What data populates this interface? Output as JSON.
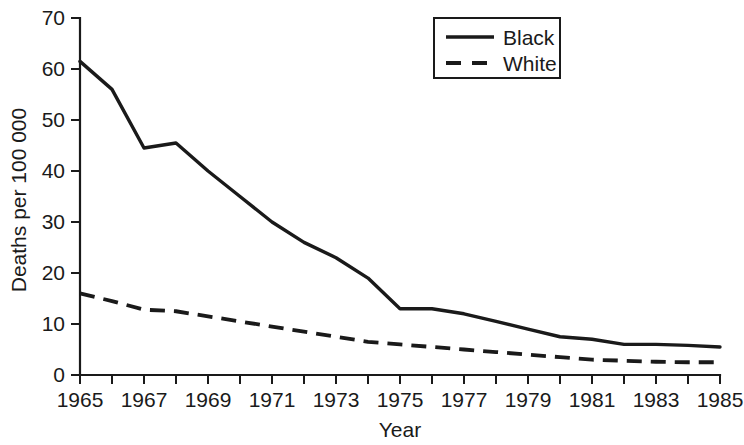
{
  "chart_data": {
    "type": "line",
    "title": "",
    "xlabel": "Year",
    "ylabel": "Deaths per 100 000",
    "xlim": [
      1965,
      1985
    ],
    "ylim": [
      0,
      70
    ],
    "grid": false,
    "legend_position": "top-right",
    "x": [
      1965,
      1966,
      1967,
      1968,
      1969,
      1970,
      1971,
      1972,
      1973,
      1974,
      1975,
      1976,
      1977,
      1978,
      1979,
      1980,
      1981,
      1982,
      1983,
      1984,
      1985
    ],
    "xticks": [
      1965,
      1966,
      1967,
      1968,
      1969,
      1970,
      1971,
      1972,
      1973,
      1974,
      1975,
      1976,
      1977,
      1978,
      1979,
      1980,
      1981,
      1982,
      1983,
      1984,
      1985
    ],
    "xtick_labels": [
      "1965",
      "",
      "1967",
      "",
      "1969",
      "",
      "1971",
      "",
      "1973",
      "",
      "1975",
      "",
      "1977",
      "",
      "1979",
      "",
      "1981",
      "",
      "1983",
      "",
      "1985"
    ],
    "yticks": [
      0,
      10,
      20,
      30,
      40,
      50,
      60,
      70
    ],
    "ytick_labels": [
      "0",
      "10",
      "20",
      "30",
      "40",
      "50",
      "60",
      "70"
    ],
    "series": [
      {
        "name": "Black",
        "style": "solid",
        "color": "#1a1a1a",
        "values": [
          61.5,
          56.0,
          44.5,
          45.5,
          40.0,
          35.0,
          30.0,
          26.0,
          23.0,
          19.0,
          13.0,
          13.0,
          12.0,
          10.5,
          9.0,
          7.5,
          7.0,
          6.0,
          6.0,
          5.8,
          5.5
        ]
      },
      {
        "name": "White",
        "style": "dashed",
        "color": "#1a1a1a",
        "values": [
          16.0,
          14.5,
          12.8,
          12.5,
          11.5,
          10.5,
          9.5,
          8.5,
          7.5,
          6.5,
          6.0,
          5.5,
          5.0,
          4.5,
          4.0,
          3.5,
          3.0,
          2.8,
          2.6,
          2.5,
          2.5
        ]
      }
    ]
  },
  "axes": {
    "y_title": "Deaths per 100 000",
    "x_title": "Year"
  },
  "legend": {
    "entries": [
      {
        "label": "Black"
      },
      {
        "label": "White"
      }
    ]
  }
}
